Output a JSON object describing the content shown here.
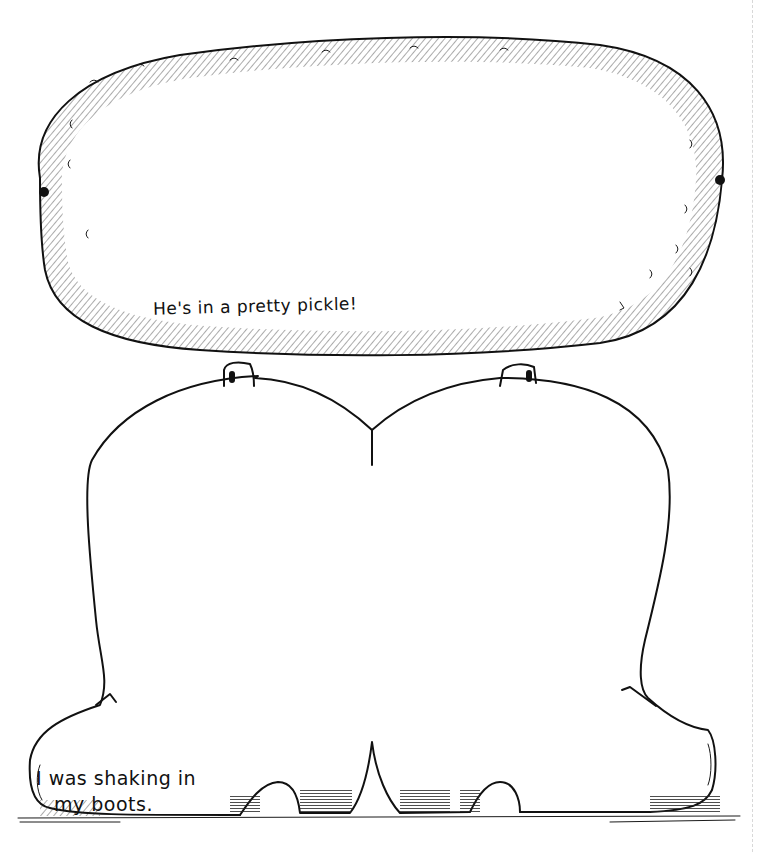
{
  "illustration": {
    "subjects": [
      "pickle",
      "pair-of-boots"
    ],
    "style": "black-and-white line art",
    "colors": {
      "ink": "#111111",
      "paper": "#ffffff"
    }
  },
  "pickle": {
    "caption": "He's in a pretty pickle!"
  },
  "boots": {
    "caption_line1": "I was shaking in",
    "caption_line2": "my boots."
  }
}
